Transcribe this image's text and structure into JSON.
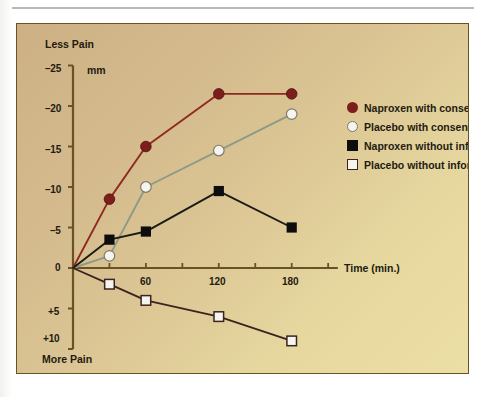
{
  "chart_data": {
    "type": "line",
    "title": "",
    "xlabel": "Time (min.)",
    "ylabel": "mm",
    "y_top_caption": "Less Pain",
    "y_bottom_caption": "More Pain",
    "xlim": [
      0,
      210
    ],
    "ylim": [
      -25,
      10
    ],
    "y_axis_inverted": true,
    "grid": false,
    "legend_position": "right",
    "x_tick_interval": 30,
    "x_ticks": [
      0,
      30,
      60,
      90,
      120,
      150,
      180,
      210
    ],
    "x_tick_labels": [
      "",
      "",
      "60",
      "",
      "120",
      "",
      "180",
      ""
    ],
    "y_ticks": [
      -25,
      -20,
      -15,
      -10,
      -5,
      0,
      5,
      10
    ],
    "y_tick_labels": [
      "–25",
      "–20",
      "–15",
      "–10",
      "–5",
      "0",
      "+5",
      "+10"
    ],
    "x": [
      0,
      30,
      60,
      120,
      180
    ],
    "series": [
      {
        "name": "Naproxen with consent",
        "marker": "filled-circle",
        "color": "#7d1d1c",
        "line_color": "#8e2a21",
        "values": [
          0,
          -8.5,
          -15,
          -21.5,
          -21.5
        ]
      },
      {
        "name": "Placebo with consent",
        "marker": "open-circle",
        "color": "#f6f4ee",
        "line_color": "#8d9a87",
        "values": [
          0,
          -1.5,
          -10,
          -14.5,
          -19
        ]
      },
      {
        "name": "Naproxen without informatio",
        "marker": "filled-square",
        "color": "#0d0d0d",
        "line_color": "#1a1a14",
        "values": [
          0,
          -3.5,
          -4.5,
          -9.5,
          -5
        ]
      },
      {
        "name": "Placebo without information",
        "marker": "open-square",
        "color": "#f6f4ee",
        "line_color": "#3a2420",
        "values": [
          0,
          2,
          4,
          6,
          9
        ]
      }
    ]
  },
  "axis": {
    "unit_label": "mm",
    "x_axis_label": "Time (min.)",
    "less_pain": "Less Pain",
    "more_pain": "More Pain",
    "y_labels": [
      "–25",
      "–20",
      "–15",
      "–10",
      "–5",
      "0",
      "+5",
      "+10"
    ],
    "x_labels": [
      "60",
      "120",
      "180"
    ]
  },
  "legend": {
    "items": [
      {
        "label": "Naproxen with consent",
        "marker": "filled-circle-icon"
      },
      {
        "label": "Placebo with consent",
        "marker": "open-circle-icon"
      },
      {
        "label": "Naproxen without informatio",
        "marker": "filled-square-icon"
      },
      {
        "label": "Placebo without information",
        "marker": "open-square-icon"
      }
    ]
  },
  "colors": {
    "naproxen_consent": "#7d1d1c",
    "placebo_consent_line": "#8d9a87",
    "naproxen_no_info": "#0d0d0d",
    "placebo_no_info": "#3a2420",
    "axis": "#6b5226",
    "panel_border": "#6b5226",
    "text": "#231b10"
  }
}
